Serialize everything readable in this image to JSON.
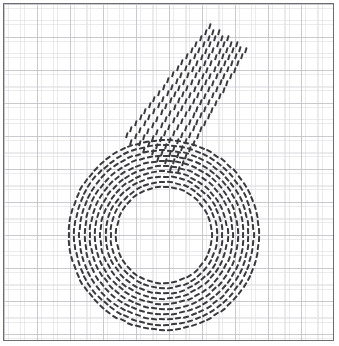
{
  "figure": {
    "width": 339,
    "height": 346,
    "background_color": "#ffffff",
    "panel": {
      "x": 3,
      "y": 3,
      "width": 331,
      "height": 338,
      "border_color": "#6b6b70",
      "border_width": 1.5,
      "background_color": "#ffffff"
    },
    "grid": {
      "visible": true,
      "style": "dotted",
      "minor_spacing": 16.5,
      "major_spacing": 33,
      "minor_color": "#d0d0d6",
      "major_color": "#babac2"
    }
  },
  "glyph": {
    "label": "6",
    "description": "Handwritten digit six drawn as a texture of short dark dashes",
    "dash_color": "#3a3a3e",
    "dash_length": 6,
    "dash_thickness": 2.1,
    "parts": [
      {
        "name": "diagonal-stem",
        "type": "lattice",
        "start_x": 224,
        "start_y": 34,
        "end_x": 146,
        "end_y": 152,
        "rows": 9,
        "row_spacing": 7.4,
        "step_along": 7.6,
        "dash_angle_offset": -18,
        "taper_start": 0.72,
        "taper_end": 1.06
      },
      {
        "name": "bowl-loop",
        "type": "concentric-rings",
        "center_x": 160,
        "center_y": 231,
        "inner_radius": 48,
        "outer_radius": 95,
        "ring_count": 10,
        "dash_arc_spacing": 8.2,
        "orientation": "tangential"
      }
    ]
  },
  "chart_data": {
    "type": "scatter",
    "title": "",
    "xlabel": "",
    "ylabel": "",
    "grid": true,
    "legend": null,
    "xlim": [
      0,
      331
    ],
    "ylim": [
      0,
      338
    ],
    "series": [
      {
        "name": "diagonal-stem-dashes",
        "marker": "dash",
        "color": "#3a3a3e",
        "count_rows": 9,
        "count_approx": 150
      },
      {
        "name": "bowl-loop-dashes",
        "marker": "dash",
        "color": "#3a3a3e",
        "count_rings": 10,
        "count_approx": 540
      }
    ]
  }
}
